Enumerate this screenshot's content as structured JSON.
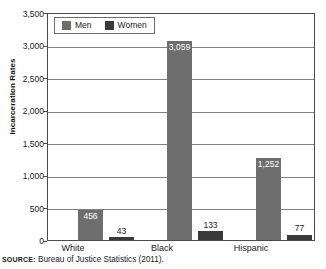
{
  "chart_data": {
    "type": "bar",
    "title": "",
    "xlabel": "",
    "ylabel": "Incarceration Rates",
    "categories": [
      "White",
      "Black",
      "Hispanic"
    ],
    "series": [
      {
        "name": "Men",
        "color": "#6e6e6e",
        "values": [
          456,
          3059,
          1252
        ],
        "value_labels": [
          "456",
          "3,059",
          "1,252"
        ]
      },
      {
        "name": "Women",
        "color": "#3a3a3a",
        "values": [
          43,
          133,
          77
        ],
        "value_labels": [
          "43",
          "133",
          "77"
        ]
      }
    ],
    "ylim": [
      0,
      3500
    ],
    "yticks": [
      0,
      500,
      1000,
      1500,
      2000,
      2500,
      3000,
      3500
    ],
    "ytick_labels": [
      "0",
      "500",
      "1,000",
      "1,500",
      "2,000",
      "2,500",
      "3,000",
      "3,500"
    ],
    "grid": true,
    "legend_position": "top-left"
  },
  "legend": {
    "items": [
      {
        "label": "Men",
        "color": "#6e6e6e"
      },
      {
        "label": "Women",
        "color": "#3a3a3a"
      }
    ]
  },
  "source": {
    "prefix": "SOURCE:",
    "text": "Bureau of Justice Statistics (2011)."
  }
}
